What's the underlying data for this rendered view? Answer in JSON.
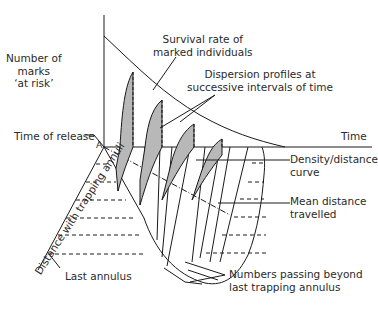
{
  "diagram": {
    "labels": {
      "y_axis": [
        "Number of",
        "marks",
        "‘at risk’"
      ],
      "survival": [
        "Survival rate of",
        "marked individuals"
      ],
      "dispersion": [
        "Dispersion profiles at",
        "successive intervals of time"
      ],
      "time_axis": "Time",
      "time_of_release": "Time of release",
      "origin_point": "A",
      "density_curve": [
        "Density/distance",
        "curve"
      ],
      "mean_distance": [
        "Mean distance",
        "travelled"
      ],
      "distance_axis": "Distance with trapping annuli",
      "last_annulus": "Last annulus",
      "numbers_passing": [
        "Numbers passing beyond",
        "last trapping annulus"
      ]
    },
    "colors": {
      "line": "#1a1a1a",
      "shade": "#b8b8b8",
      "text": "#2a2a2a"
    }
  }
}
